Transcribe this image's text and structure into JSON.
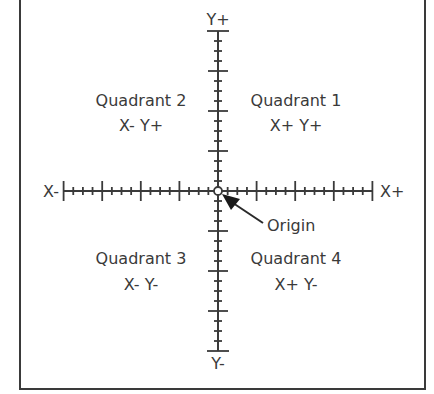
{
  "diagram": {
    "axis_labels": {
      "y_pos": "Y+",
      "y_neg": "Y-",
      "x_pos": "X+",
      "x_neg": "X-"
    },
    "quadrants": [
      {
        "name": "Quadrant 1",
        "signs": "X+ Y+"
      },
      {
        "name": "Quadrant 2",
        "signs": "X- Y+"
      },
      {
        "name": "Quadrant 3",
        "signs": "X- Y-"
      },
      {
        "name": "Quadrant 4",
        "signs": "X+ Y-"
      }
    ],
    "origin_label": "Origin",
    "colors": {
      "ink": "#3a3a3a",
      "background": "#ffffff"
    }
  }
}
